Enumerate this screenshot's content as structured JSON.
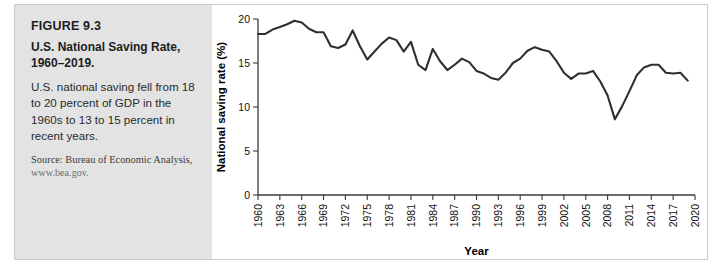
{
  "caption": {
    "figure_number": "FIGURE 9.3",
    "title": "U.S. National Saving Rate, 1960–2019.",
    "description": "U.S. national saving fell from 18 to 20 percent of GDP in the 1960s to 13 to 15 percent in recent years.",
    "source": "Source: Bureau of Economic Analysis,",
    "source_url": "www.bea.gov."
  },
  "chart_data": {
    "type": "line",
    "title": "",
    "xlabel": "Year",
    "ylabel": "National saving rate (%)",
    "xlim": [
      1960,
      2020
    ],
    "ylim": [
      0,
      20
    ],
    "yticks": [
      0,
      5,
      10,
      15,
      20
    ],
    "ytick_labels": [
      "0",
      "5",
      "10",
      "15",
      "20"
    ],
    "xticks": [
      1960,
      1963,
      1966,
      1969,
      1972,
      1975,
      1978,
      1981,
      1984,
      1987,
      1990,
      1993,
      1996,
      1999,
      2002,
      2005,
      2008,
      2011,
      2014,
      2017,
      2020
    ],
    "xtick_labels": [
      "1960",
      "1963",
      "1966",
      "1969",
      "1972",
      "1975",
      "1978",
      "1981",
      "1984",
      "1987",
      "1990",
      "1993",
      "1996",
      "1999",
      "2002",
      "2005",
      "2008",
      "2011",
      "2014",
      "2017",
      "2020"
    ],
    "grid": false,
    "legend": false,
    "line_color": "#2f2f2f",
    "series": [
      {
        "name": "U.S. national saving rate",
        "x": [
          1960,
          1961,
          1962,
          1963,
          1964,
          1965,
          1966,
          1967,
          1968,
          1969,
          1970,
          1971,
          1972,
          1973,
          1974,
          1975,
          1976,
          1977,
          1978,
          1979,
          1980,
          1981,
          1982,
          1983,
          1984,
          1985,
          1986,
          1987,
          1988,
          1989,
          1990,
          1991,
          1992,
          1993,
          1994,
          1995,
          1996,
          1997,
          1998,
          1999,
          2000,
          2001,
          2002,
          2003,
          2004,
          2005,
          2006,
          2007,
          2008,
          2009,
          2010,
          2011,
          2012,
          2013,
          2014,
          2015,
          2016,
          2017,
          2018,
          2019
        ],
        "values": [
          18.3,
          18.3,
          18.8,
          19.1,
          19.4,
          19.8,
          19.6,
          18.9,
          18.5,
          18.5,
          16.9,
          16.7,
          17.1,
          18.7,
          16.9,
          15.4,
          16.3,
          17.2,
          17.9,
          17.6,
          16.3,
          17.4,
          14.8,
          14.2,
          16.6,
          15.2,
          14.2,
          14.8,
          15.5,
          15.1,
          14.1,
          13.8,
          13.3,
          13.1,
          13.9,
          15.0,
          15.5,
          16.4,
          16.8,
          16.5,
          16.3,
          15.2,
          13.9,
          13.2,
          13.8,
          13.8,
          14.1,
          12.9,
          11.3,
          8.6,
          10.1,
          11.8,
          13.6,
          14.5,
          14.8,
          14.8,
          13.9,
          13.8,
          13.9,
          13.0
        ]
      }
    ]
  }
}
